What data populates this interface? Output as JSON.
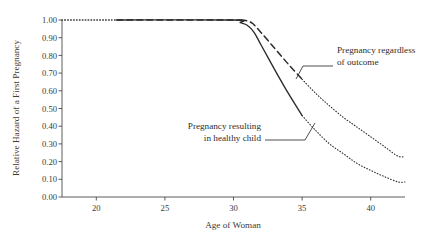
{
  "figure": {
    "background_color": "#ffffff",
    "ink_color": "#2b2b2b"
  },
  "chart_data": {
    "type": "line",
    "title": "",
    "xlabel": "Age of Woman",
    "ylabel": "Relative Hazard of a First Pregnancy",
    "xlim": [
      17.5,
      42.5
    ],
    "ylim": [
      0.0,
      1.0
    ],
    "grid": false,
    "legend": "annotations-inline",
    "xticks": [
      20,
      25,
      30,
      35,
      40
    ],
    "xticklabels": [
      "20",
      "25",
      "30",
      "35",
      "40"
    ],
    "yticks": [
      0.0,
      0.1,
      0.2,
      0.3,
      0.4,
      0.5,
      0.6,
      0.7,
      0.8,
      0.9,
      1.0
    ],
    "yticklabels": [
      "0.00",
      "0.10",
      "0.20",
      "0.30",
      "0.40",
      "0.50",
      "0.60",
      "0.70",
      "0.80",
      "0.90",
      "1.00"
    ],
    "series": [
      {
        "name": "Pregnancy regardless of outcome",
        "style": "dashed",
        "x": [
          17.5,
          21.5,
          30.0,
          30.6,
          31.0,
          31.4,
          32.0,
          33.0,
          34.0,
          35.0,
          36.0,
          37.0,
          38.0,
          39.0,
          40.0,
          41.0,
          42.0
        ],
        "values": [
          1.0,
          1.0,
          1.0,
          1.0,
          0.995,
          0.98,
          0.93,
          0.84,
          0.75,
          0.665,
          0.585,
          0.515,
          0.45,
          0.395,
          0.34,
          0.285,
          0.23
        ]
      },
      {
        "name": "Pregnancy resulting in healthy child",
        "style": "solid",
        "x": [
          17.5,
          21.5,
          30.0,
          30.5,
          31.0,
          31.5,
          32.0,
          33.0,
          34.0,
          35.0,
          36.0,
          37.0,
          38.0,
          39.0,
          40.0,
          41.0,
          42.0
        ],
        "values": [
          1.0,
          1.0,
          1.0,
          0.985,
          0.97,
          0.93,
          0.86,
          0.72,
          0.585,
          0.46,
          0.375,
          0.3,
          0.245,
          0.19,
          0.15,
          0.115,
          0.085
        ]
      }
    ],
    "line_style_segments": {
      "note": "both curves drawn dotted below age 21.5 and above age 35; drawn dashed/solid in between",
      "dotted_left_end_age": 21.5,
      "dotted_right_start_age": 35.0
    },
    "annotations": [
      {
        "text_line1": "Pregnancy regardless",
        "text_line2": "of outcome",
        "target_series": "Pregnancy regardless of outcome"
      },
      {
        "text_line1": "Pregnancy resulting",
        "text_line2": "in healthy child",
        "target_series": "Pregnancy resulting in healthy child"
      }
    ]
  }
}
